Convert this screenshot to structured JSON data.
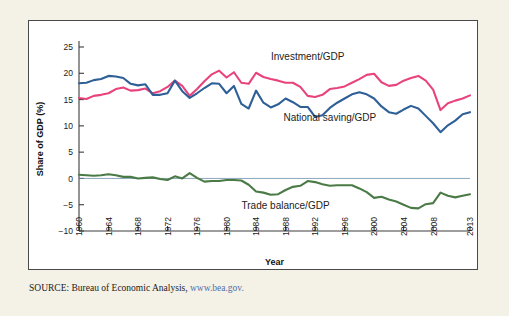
{
  "figure": {
    "background_color": "#f4f1e7",
    "panel_color": "#ffffff",
    "source_prefix": "SOURCE:",
    "source_text": " Bureau of Economic Analysis, ",
    "source_url": "www.bea.gov."
  },
  "chart_data": {
    "type": "line",
    "title": "",
    "xlabel": "Year",
    "ylabel": "Share of GDP (%)",
    "xlim": [
      1960,
      2013
    ],
    "ylim": [
      -10,
      25
    ],
    "yticks": [
      25,
      20,
      15,
      10,
      5,
      0,
      -5,
      -10
    ],
    "ytick_labels": [
      "25",
      "20",
      "15",
      "10",
      "5",
      "0",
      "−5",
      "−10"
    ],
    "xticks": [
      1960,
      1964,
      1968,
      1972,
      1976,
      1980,
      1984,
      1988,
      1992,
      1996,
      2000,
      2004,
      2008,
      2013
    ],
    "xtick_labels": [
      "1960",
      "1964",
      "1968",
      "1972",
      "1976",
      "1980",
      "1984",
      "1988",
      "1992",
      "1996",
      "2000",
      "2004",
      "2008",
      "2013"
    ],
    "grid": false,
    "legend_position": "inline-annotations",
    "zero_reference_line": 0,
    "x": [
      1960,
      1961,
      1962,
      1963,
      1964,
      1965,
      1966,
      1967,
      1968,
      1969,
      1970,
      1971,
      1972,
      1973,
      1974,
      1975,
      1976,
      1977,
      1978,
      1979,
      1980,
      1981,
      1982,
      1983,
      1984,
      1985,
      1986,
      1987,
      1988,
      1989,
      1990,
      1991,
      1992,
      1993,
      1994,
      1995,
      1996,
      1997,
      1998,
      1999,
      2000,
      2001,
      2002,
      2003,
      2004,
      2005,
      2006,
      2007,
      2008,
      2009,
      2010,
      2011,
      2012,
      2013
    ],
    "series": [
      {
        "name": "Investment/GDP",
        "color": "#e8437d",
        "label_x": 1991,
        "label_y": 22.6,
        "values": [
          15.3,
          15.1,
          15.7,
          15.9,
          16.2,
          17.0,
          17.3,
          16.7,
          16.8,
          17.1,
          16.2,
          16.6,
          17.4,
          18.6,
          17.6,
          15.7,
          17.0,
          18.5,
          19.8,
          20.5,
          19.2,
          20.2,
          18.2,
          18.0,
          20.1,
          19.3,
          18.9,
          18.6,
          18.2,
          18.2,
          17.4,
          15.7,
          15.5,
          15.9,
          17.0,
          17.2,
          17.5,
          18.2,
          18.9,
          19.7,
          19.9,
          18.3,
          17.6,
          17.8,
          18.6,
          19.1,
          19.5,
          18.6,
          16.9,
          13.0,
          14.3,
          14.8,
          15.2,
          15.8
        ]
      },
      {
        "name": "National saving/GDP",
        "color": "#2e5f96",
        "label_x": 1994,
        "label_y": 10.9,
        "values": [
          18.1,
          18.2,
          18.7,
          18.9,
          19.5,
          19.4,
          19.1,
          18.0,
          17.7,
          17.9,
          15.9,
          15.9,
          16.2,
          18.6,
          16.6,
          15.3,
          16.2,
          17.2,
          18.1,
          18.0,
          16.2,
          17.6,
          14.2,
          13.3,
          16.7,
          14.4,
          13.5,
          14.1,
          15.2,
          14.5,
          13.6,
          13.6,
          11.7,
          12.0,
          13.4,
          14.4,
          15.2,
          16.0,
          16.4,
          16.0,
          15.2,
          13.7,
          12.6,
          12.3,
          13.1,
          13.8,
          13.3,
          11.9,
          10.5,
          8.8,
          10.1,
          11.0,
          12.2,
          12.6
        ]
      },
      {
        "name": "Trade balance/GDP",
        "color": "#4a7a45",
        "label_x": 1988,
        "label_y": -5.9,
        "values": [
          0.7,
          0.6,
          0.5,
          0.6,
          0.8,
          0.6,
          0.3,
          0.3,
          0.0,
          0.1,
          0.2,
          -0.1,
          -0.3,
          0.4,
          0.0,
          1.0,
          0.1,
          -0.6,
          -0.5,
          -0.5,
          -0.3,
          -0.3,
          -0.4,
          -1.2,
          -2.5,
          -2.7,
          -3.1,
          -3.0,
          -2.2,
          -1.6,
          -1.4,
          -0.5,
          -0.7,
          -1.1,
          -1.4,
          -1.3,
          -1.3,
          -1.3,
          -1.9,
          -2.6,
          -3.7,
          -3.5,
          -4.0,
          -4.4,
          -5.0,
          -5.6,
          -5.7,
          -4.9,
          -4.7,
          -2.7,
          -3.3,
          -3.6,
          -3.3,
          -3.0
        ]
      }
    ]
  }
}
